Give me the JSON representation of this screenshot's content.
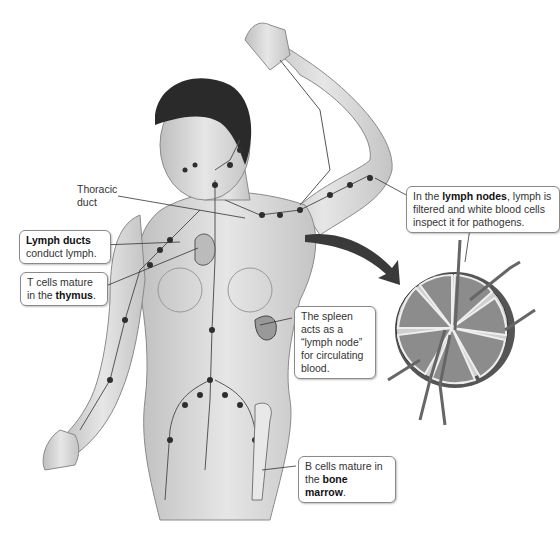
{
  "diagram": {
    "labels": {
      "thoracic_duct": {
        "line1": "Thoracic",
        "line2": "duct"
      },
      "lymph_ducts": {
        "bold": "Lymph ducts",
        "rest": "conduct lymph."
      },
      "thymus": {
        "line1": "T cells mature",
        "pre": "in the ",
        "bold": "thymus",
        "post": "."
      },
      "lymph_nodes": {
        "pre": "In the ",
        "bold": "lymph nodes",
        "line1_post": ", lymph is",
        "line2": "filtered and white blood cells",
        "line3": "inspect it for pathogens."
      },
      "spleen": {
        "line1": "The spleen",
        "line2": "acts as a",
        "line3": "“lymph node”",
        "line4": "for circulating",
        "line5": "blood."
      },
      "bone_marrow": {
        "line1": "B cells mature in",
        "pre": "the ",
        "bold": "bone marrow",
        "post": "."
      }
    },
    "colors": {
      "vessel": "#555555",
      "node": "#2e2e2e",
      "skin": "#d9d9d9",
      "hair": "#2a2a2a",
      "arrow": "#3a3a3a"
    }
  }
}
